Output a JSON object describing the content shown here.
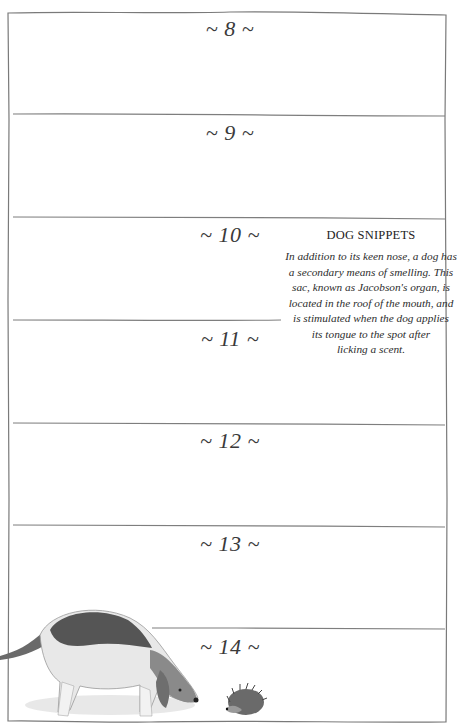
{
  "page": {
    "days": [
      {
        "label": "~ 8 ~"
      },
      {
        "label": "~ 9 ~"
      },
      {
        "label": "~ 10 ~"
      },
      {
        "label": "~ 11 ~"
      },
      {
        "label": "~ 12 ~"
      },
      {
        "label": "~ 13 ~"
      },
      {
        "label": "~ 14 ~"
      }
    ],
    "sidebar": {
      "title": "DOG SNIPPETS",
      "lines": [
        "In addition to its keen nose, a dog has",
        "a secondary means of smelling. This",
        "sac, known as Jacobson's organ, is",
        "located in the roof of the mouth, and",
        "is stimulated when the dog applies",
        "its tongue to the spot after",
        "licking a scent."
      ]
    },
    "illustration": {
      "subjects": [
        "beagle-dog",
        "hedgehog"
      ]
    },
    "colors": {
      "line": "#7a7a7a",
      "text": "#333333",
      "background": "#ffffff"
    }
  }
}
